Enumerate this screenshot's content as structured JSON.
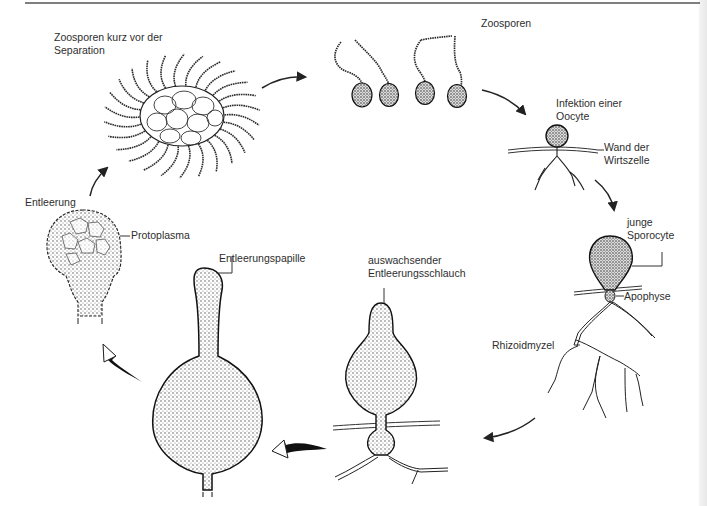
{
  "diagram": {
    "type": "life-cycle",
    "labels": {
      "zoosporen_separation": [
        "Zoosporen kurz vor der",
        "Separation"
      ],
      "zoosporen": "Zoosporen",
      "infektion": [
        "Infektion einer",
        "Oocyte"
      ],
      "wand": [
        "Wand der",
        "Wirtszelle"
      ],
      "junge_sporocyte": [
        "junge",
        "Sporocyte"
      ],
      "apophyse": "Apophyse",
      "rhizoidmyzel": "Rhizoidmyzel",
      "entleerungsschlauch": [
        "auswachsender",
        "Entleerungsschlauch"
      ],
      "entleerungspapille": "Entleerungspapille",
      "entleerung": "Entleerung",
      "protoplasma": "Protoplasma"
    },
    "stages": [
      "Zoosporen kurz vor der Separation",
      "Zoosporen",
      "Infektion einer Oocyte",
      "junge Sporocyte",
      "auswachsender Entleerungsschlauch",
      "Entleerungspapille",
      "Entleerung"
    ],
    "colors": {
      "ink": "#1a1a1a",
      "stipple": "#7a7a7a",
      "fill": "#cfcfcf"
    }
  }
}
